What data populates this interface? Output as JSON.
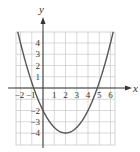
{
  "chart_data": {
    "type": "line",
    "title": "",
    "xlabel": "x",
    "ylabel": "y",
    "function": "y = 0.5(x - 2)^2 - 4",
    "x_ticks": [
      "-2",
      "-1",
      "1",
      "2",
      "3",
      "4",
      "5",
      "6"
    ],
    "y_ticks": [
      "4",
      "3",
      "2",
      "1",
      "-2",
      "-3",
      "-4"
    ],
    "xlim": [
      -2.4,
      6.4
    ],
    "ylim": [
      -5,
      5
    ],
    "grid": true,
    "series": [
      {
        "name": "parabola",
        "x": [
          -2.24,
          -2,
          -1,
          0,
          1,
          2,
          3,
          4,
          5,
          6,
          6.24
        ],
        "y": [
          5,
          4,
          0.5,
          -2,
          -3.5,
          -4,
          -3.5,
          -2,
          0.5,
          4,
          5
        ]
      }
    ],
    "annotations": {
      "vertex": [
        2,
        -4
      ],
      "y_intercept": -2,
      "x_intercepts": [
        -0.83,
        4.83
      ]
    }
  },
  "colors": {
    "grid": "#c8c8c8",
    "axis": "#333333",
    "curve": "#555555"
  }
}
